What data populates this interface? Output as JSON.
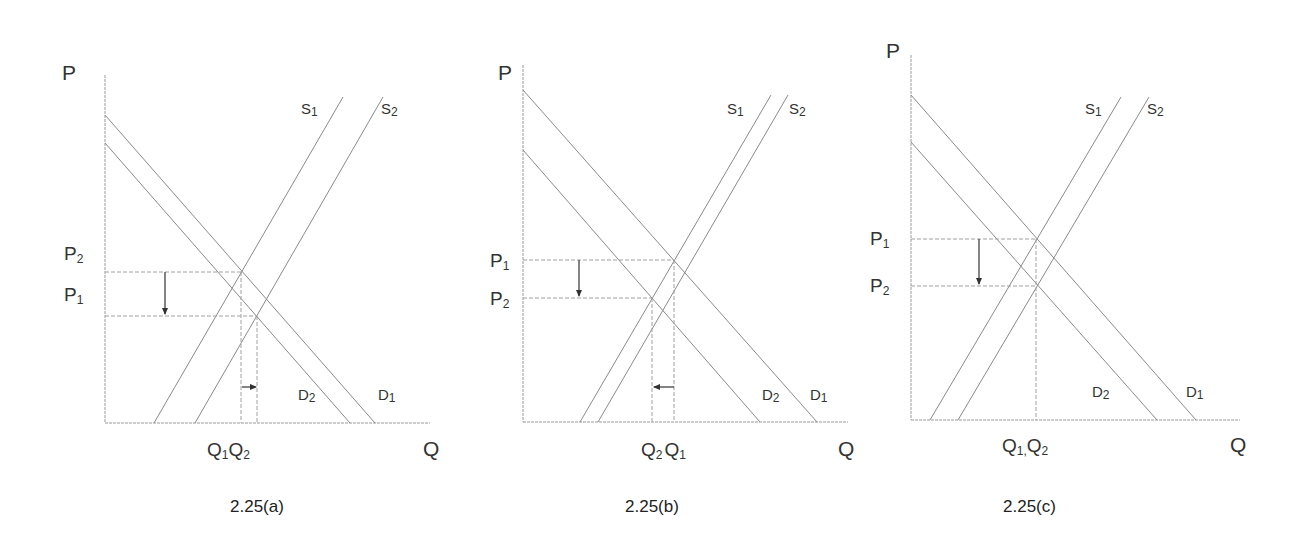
{
  "panels": [
    {
      "id": "a",
      "caption": "2.25(a)",
      "axis_p": "P",
      "axis_q": "Q",
      "price_labels": [
        {
          "base": "P",
          "sub": "2",
          "y": 258
        },
        {
          "base": "P",
          "sub": "1",
          "y": 300
        }
      ],
      "qty_label": {
        "text_parts": [
          {
            "base": "Q",
            "sub": "1"
          },
          {
            "base": "Q",
            "sub": "2"
          }
        ]
      },
      "curves": {
        "S1": "S",
        "S1_sub": "1",
        "S2": "S",
        "S2_sub": "2",
        "D1": "D",
        "D1_sub": "1",
        "D2": "D",
        "D2_sub": "2"
      }
    },
    {
      "id": "b",
      "caption": "2.25(b)",
      "axis_p": "P",
      "axis_q": "Q",
      "price_labels": [
        {
          "base": "P",
          "sub": "1"
        },
        {
          "base": "P",
          "sub": "2"
        }
      ],
      "qty_label": {
        "text_parts": [
          {
            "base": "Q",
            "sub": "2"
          },
          {
            "base": "Q",
            "sub": "1"
          }
        ]
      },
      "curves": {
        "S1": "S",
        "S1_sub": "1",
        "S2": "S",
        "S2_sub": "2",
        "D1": "D",
        "D1_sub": "1",
        "D2": "D",
        "D2_sub": "2"
      }
    },
    {
      "id": "c",
      "caption": "2.25(c)",
      "axis_p": "P",
      "axis_q": "Q",
      "price_labels": [
        {
          "base": "P",
          "sub": "1"
        },
        {
          "base": "P",
          "sub": "2"
        }
      ],
      "qty_label": {
        "text_parts": [
          {
            "base": "Q",
            "sub": "1"
          },
          {
            "base": "Q",
            "sub": "2"
          }
        ],
        "separator": ","
      },
      "curves": {
        "S1": "S",
        "S1_sub": "1",
        "S2": "S",
        "S2_sub": "2",
        "D1": "D",
        "D1_sub": "1",
        "D2": "D",
        "D2_sub": "2"
      }
    }
  ],
  "colors": {
    "line": "#8a8a8a",
    "text": "#333333",
    "background": "#ffffff"
  }
}
